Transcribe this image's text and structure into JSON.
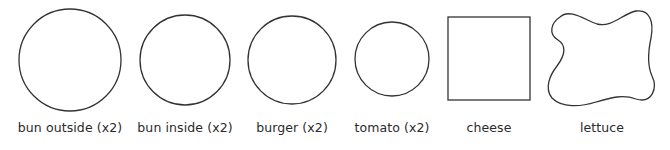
{
  "diagram": {
    "stroke_color": "#333333",
    "background": "#ffffff",
    "items": [
      {
        "id": "bun-outside",
        "label": "bun outside (x2)",
        "shape": "circle",
        "cx": 70,
        "cy": 60,
        "r": 51
      },
      {
        "id": "bun-inside",
        "label": "bun inside (x2)",
        "shape": "circle",
        "cx": 185,
        "cy": 60,
        "r": 45
      },
      {
        "id": "burger",
        "label": "burger (x2)",
        "shape": "circle",
        "cx": 292,
        "cy": 60,
        "r": 44
      },
      {
        "id": "tomato",
        "label": "tomato (x2)",
        "shape": "circle",
        "cx": 392,
        "cy": 59,
        "r": 37
      },
      {
        "id": "cheese",
        "label": "cheese",
        "shape": "square",
        "x": 448,
        "y": 17,
        "w": 82,
        "h": 83
      },
      {
        "id": "lettuce",
        "label": "lettuce",
        "shape": "blob"
      }
    ]
  }
}
